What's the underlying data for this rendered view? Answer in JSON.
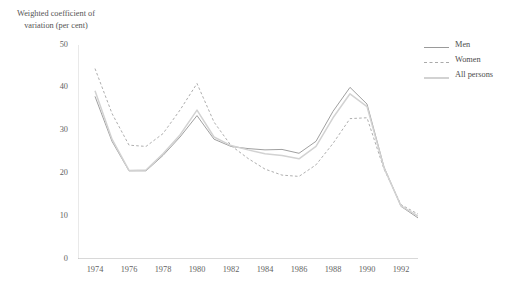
{
  "title_fragment": "",
  "legend": {
    "position": "right",
    "items": [
      {
        "label": "Men",
        "style": "solid",
        "color": "#9a9a9a"
      },
      {
        "label": "Women",
        "style": "dashed",
        "color": "#aaaaaa"
      },
      {
        "label": "All persons",
        "style": "solid",
        "color": "#d2d2d2"
      }
    ]
  },
  "chart_data": {
    "type": "line",
    "title": "",
    "xlabel": "",
    "ylabel": "Weighted coefficient of variation (per cent)",
    "xlim": [
      1973,
      1993
    ],
    "ylim": [
      0,
      50
    ],
    "grid": false,
    "x": [
      1974,
      1975,
      1976,
      1977,
      1978,
      1979,
      1980,
      1981,
      1982,
      1983,
      1984,
      1985,
      1986,
      1987,
      1988,
      1989,
      1990,
      1991,
      1992,
      1993
    ],
    "xticks": [
      1974,
      1976,
      1978,
      1980,
      1982,
      1984,
      1986,
      1988,
      1990,
      1992
    ],
    "xtick_labels": [
      "1974",
      "1976",
      "1978",
      "1980",
      "1982",
      "1984",
      "1986",
      "1988",
      "1990",
      "1992"
    ],
    "xtick_minor_every": 1,
    "yticks": [
      0,
      10,
      20,
      30,
      40,
      50
    ],
    "ytick_labels": [
      "0",
      "10",
      "20",
      "30",
      "40",
      "50"
    ],
    "series": [
      {
        "name": "Men",
        "style": "solid",
        "color": "#9a9a9a",
        "values": [
          38.0,
          27.5,
          20.6,
          20.6,
          24.2,
          28.5,
          33.5,
          28.0,
          26.3,
          25.8,
          25.5,
          25.6,
          24.7,
          27.5,
          34.5,
          40.1,
          36.2,
          21.5,
          12.3,
          9.6
        ]
      },
      {
        "name": "Women",
        "style": "dashed",
        "color": "#aaaaaa",
        "values": [
          44.5,
          34.0,
          26.6,
          26.3,
          29.3,
          34.8,
          41.0,
          32.0,
          26.5,
          23.5,
          21.0,
          19.6,
          19.3,
          22.0,
          27.0,
          32.8,
          33.0,
          21.0,
          12.7,
          10.5
        ]
      },
      {
        "name": "All persons",
        "style": "solid",
        "color": "#d2d2d2",
        "values": [
          39.3,
          28.0,
          20.7,
          20.8,
          24.6,
          29.0,
          34.8,
          28.5,
          26.5,
          25.5,
          24.6,
          24.2,
          23.4,
          26.3,
          33.0,
          38.6,
          35.6,
          21.3,
          12.4,
          10.0
        ]
      }
    ]
  }
}
